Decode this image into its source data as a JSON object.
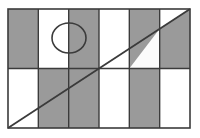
{
  "figure": {
    "colors": {
      "shaded_fill": "#9a9a9a",
      "white_fill": "#fbfbfb",
      "stroke": "#3b3b3b",
      "background": "#ffffff"
    },
    "canvas": {
      "width": 200,
      "height": 138
    },
    "rectangle": {
      "label": "outer-rectangle",
      "x": 8,
      "y": 9,
      "width": 182,
      "height": 119,
      "columns": 6,
      "rows": 2,
      "column_width": 30.33,
      "row_height": 59.5,
      "stroke_width": 1.6
    },
    "cells": [
      {
        "name": "cell-r1c1",
        "row": 1,
        "col": 1,
        "fill": "shaded"
      },
      {
        "name": "cell-r1c2",
        "row": 1,
        "col": 2,
        "fill": "white"
      },
      {
        "name": "cell-r1c3",
        "row": 1,
        "col": 3,
        "fill": "shaded"
      },
      {
        "name": "cell-r1c4",
        "row": 1,
        "col": 4,
        "fill": "white"
      },
      {
        "name": "cell-r1c5",
        "row": 1,
        "col": 5,
        "fill": "shaded"
      },
      {
        "name": "cell-r1c6",
        "row": 1,
        "col": 6,
        "fill": "split-diagonal"
      },
      {
        "name": "cell-r2c1",
        "row": 2,
        "col": 1,
        "fill": "white"
      },
      {
        "name": "cell-r2c2",
        "row": 2,
        "col": 2,
        "fill": "shaded"
      },
      {
        "name": "cell-r2c3",
        "row": 2,
        "col": 3,
        "fill": "shaded"
      },
      {
        "name": "cell-r2c4",
        "row": 2,
        "col": 4,
        "fill": "white"
      },
      {
        "name": "cell-r2c5",
        "row": 2,
        "col": 5,
        "fill": "shaded"
      },
      {
        "name": "cell-r2c6",
        "row": 2,
        "col": 6,
        "fill": "white"
      }
    ],
    "circle": {
      "name": "circle-shape",
      "center_x": 69,
      "center_y": 38,
      "radius_x": 17,
      "radius_y": 15,
      "stroke_width": 1.6,
      "note": "straddles the boundary between column 2 and column 3 in the top row"
    },
    "diagonal": {
      "name": "diagonal-line",
      "x1": 8,
      "y1": 128,
      "x2": 190,
      "y2": 9,
      "stroke_width": 1.8,
      "note": "runs from bottom-left corner to top-right corner of the rectangle"
    },
    "grid_lines": {
      "vertical_x": [
        38.33,
        68.67,
        99.0,
        129.33,
        159.67
      ],
      "horizontal_y": [
        68.5
      ],
      "stroke_width": 1.4
    }
  }
}
